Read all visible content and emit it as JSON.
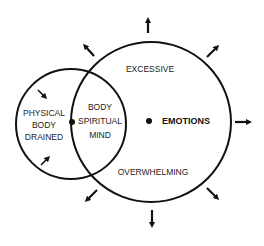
{
  "diagram": {
    "small_circle": {
      "label_lines": [
        "PHYSICAL",
        "BODY",
        "DRAINED"
      ]
    },
    "overlap": {
      "label_lines": [
        "BODY",
        "SPIRITUAL",
        "MIND"
      ]
    },
    "large_circle": {
      "center_label": "EMOTIONS",
      "top_label": "EXCESSIVE",
      "bottom_label": "OVERWHELMING"
    },
    "arrows": {
      "outward_count": 8,
      "inward_count": 2
    },
    "colors": {
      "stroke": "#111111",
      "background": "#ffffff"
    }
  }
}
